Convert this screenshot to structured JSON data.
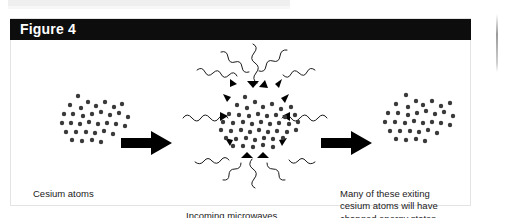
{
  "figure": {
    "title": "Figure 4",
    "header_bg": "#0d0d0d",
    "header_text_color": "#ffffff",
    "panel_bg": "#ffffff",
    "panel_border": "#e3e3e3"
  },
  "captions": {
    "left": "Cesium atoms",
    "middle": "Incoming microwaves",
    "right": "Many of these exiting\ncesium atoms will have\nchanged energy states."
  },
  "diagram": {
    "atom_color": "#3a3a3a",
    "arrow_color": "#000000",
    "wave_color": "#1a1a1a",
    "stages": [
      {
        "name": "incoming-cesium-atoms",
        "label": "Cesium atoms",
        "atom_count": 34
      },
      {
        "name": "microwave-interaction-chamber",
        "label": "Incoming microwaves",
        "atom_count": 46,
        "wave_count": 12
      },
      {
        "name": "exiting-cesium-atoms",
        "label": "Many of these exiting cesium atoms will have changed energy states.",
        "atom_count": 34
      }
    ],
    "flow_arrows": 2
  }
}
